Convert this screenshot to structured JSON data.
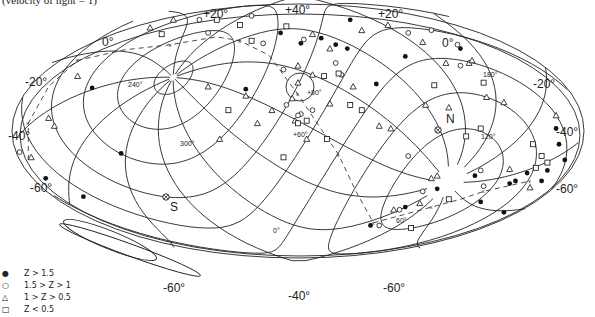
{
  "chart_data": {
    "type": "scatter",
    "title": "",
    "caption": "(velocity of light = 1)",
    "projection": "Aitoff/Hammer equal-area all-sky, galactic coordinates with superposed coordinate grid",
    "outer_labels": [
      "+20°",
      "+40°",
      "+20°",
      "0°",
      "-20°",
      "-40°",
      "-60°",
      "-60°",
      "-40°",
      "-60°",
      "-60°",
      "-40°",
      "-20°",
      "0°"
    ],
    "inner_labels": [
      "240°",
      "180°",
      "120°",
      "300°",
      "60°",
      "0°",
      "+60°",
      "+80°"
    ],
    "pole_markers": [
      {
        "name": "N",
        "label": "N"
      },
      {
        "name": "S",
        "label": "S"
      }
    ],
    "legend": [
      {
        "symbol": "filled-circle",
        "label": "Z > 1.5"
      },
      {
        "symbol": "open-circle",
        "label": "1.5 > Z > 1"
      },
      {
        "symbol": "triangle",
        "label": "1 > Z > 0.5"
      },
      {
        "symbol": "square",
        "label": "Z < 0.5"
      }
    ],
    "series": [
      {
        "name": "Z > 1.5",
        "symbol": "filled-circle",
        "points": [
          [
            0.145,
            0.305
          ],
          [
            0.41,
            0.31
          ],
          [
            0.47,
            0.095
          ],
          [
            0.505,
            0.135
          ],
          [
            0.54,
            0.115
          ],
          [
            0.565,
            0.14
          ],
          [
            0.59,
            0.045
          ],
          [
            0.585,
            0.155
          ],
          [
            0.635,
            0.29
          ],
          [
            0.78,
            0.155
          ],
          [
            0.685,
            0.185
          ],
          [
            0.945,
            0.46
          ],
          [
            0.95,
            0.52
          ],
          [
            0.96,
            0.58
          ],
          [
            0.93,
            0.62
          ],
          [
            0.92,
            0.66
          ],
          [
            0.895,
            0.63
          ],
          [
            0.875,
            0.66
          ],
          [
            0.865,
            0.67
          ],
          [
            0.855,
            0.78
          ],
          [
            0.815,
            0.74
          ],
          [
            0.805,
            0.64
          ],
          [
            0.685,
            0.76
          ],
          [
            0.74,
            0.69
          ],
          [
            0.625,
            0.83
          ],
          [
            0.195,
            0.555
          ],
          [
            0.13,
            0.72
          ],
          [
            0.065,
            0.65
          ]
        ]
      },
      {
        "name": "1.5 > Z > 1",
        "symbol": "open-circle",
        "points": [
          [
            0.33,
            0.045
          ],
          [
            0.44,
            0.135
          ],
          [
            0.345,
            0.095
          ],
          [
            0.42,
            0.03
          ],
          [
            0.51,
            0.12
          ],
          [
            0.565,
            0.21
          ],
          [
            0.475,
            0.235
          ],
          [
            0.575,
            0.255
          ],
          [
            0.69,
            0.095
          ],
          [
            0.73,
            0.085
          ],
          [
            0.775,
            0.14
          ],
          [
            0.78,
            0.22
          ],
          [
            0.02,
            0.55
          ],
          [
            0.505,
            0.405
          ],
          [
            0.5,
            0.41
          ],
          [
            0.525,
            0.39
          ],
          [
            0.48,
            0.37
          ],
          [
            0.69,
            0.565
          ],
          [
            0.815,
            0.62
          ],
          [
            0.675,
            0.77
          ],
          [
            0.715,
            0.7
          ],
          [
            0.82,
            0.68
          ],
          [
            0.64,
            0.83
          ]
        ]
      },
      {
        "name": "1 > Z > 0.5",
        "symbol": "triangle",
        "points": [
          [
            0.285,
            0.045
          ],
          [
            0.245,
            0.075
          ],
          [
            0.12,
            0.26
          ],
          [
            0.525,
            0.1
          ],
          [
            0.555,
            0.155
          ],
          [
            0.61,
            0.085
          ],
          [
            0.655,
            0.065
          ],
          [
            0.715,
            0.13
          ],
          [
            0.755,
            0.21
          ],
          [
            0.795,
            0.21
          ],
          [
            0.8,
            0.2
          ],
          [
            0.5,
            0.22
          ],
          [
            0.525,
            0.255
          ],
          [
            0.5,
            0.285
          ],
          [
            0.49,
            0.345
          ],
          [
            0.495,
            0.43
          ],
          [
            0.515,
            0.5
          ],
          [
            0.365,
            0.5
          ],
          [
            0.345,
            0.3
          ],
          [
            0.41,
            0.335
          ],
          [
            0.455,
            0.39
          ],
          [
            0.64,
            0.45
          ],
          [
            0.66,
            0.46
          ],
          [
            0.72,
            0.37
          ],
          [
            0.76,
            0.38
          ],
          [
            0.555,
            0.365
          ],
          [
            0.07,
            0.42
          ],
          [
            0.08,
            0.45
          ],
          [
            0.04,
            0.57
          ],
          [
            0.595,
            0.3
          ],
          [
            0.825,
            0.34
          ],
          [
            0.855,
            0.36
          ],
          [
            0.945,
            0.41
          ],
          [
            0.9,
            0.685
          ],
          [
            0.74,
            0.64
          ],
          [
            0.73,
            0.65
          ],
          [
            0.71,
            0.745
          ],
          [
            0.665,
            0.77
          ],
          [
            0.865,
            0.615
          ],
          [
            0.43,
            0.44
          ]
        ]
      },
      {
        "name": "Z < 0.5",
        "symbol": "square",
        "points": [
          [
            0.36,
            0.045
          ],
          [
            0.48,
            0.07
          ],
          [
            0.265,
            0.1
          ],
          [
            0.42,
            0.125
          ],
          [
            0.4,
            0.065
          ],
          [
            0.545,
            0.26
          ],
          [
            0.57,
            0.25
          ],
          [
            0.38,
            0.39
          ],
          [
            0.5,
            0.44
          ],
          [
            0.515,
            0.43
          ],
          [
            0.59,
            0.37
          ],
          [
            0.61,
            0.39
          ],
          [
            0.735,
            0.295
          ],
          [
            0.82,
            0.285
          ],
          [
            0.815,
            0.46
          ],
          [
            0.79,
            0.49
          ],
          [
            0.905,
            0.52
          ],
          [
            0.92,
            0.565
          ],
          [
            0.93,
            0.59
          ],
          [
            0.91,
            0.61
          ],
          [
            0.76,
            0.73
          ],
          [
            0.695,
            0.84
          ],
          [
            0.475,
            0.57
          ],
          [
            0.55,
            0.5
          ]
        ]
      }
    ],
    "dashed_track_label": "x"
  }
}
